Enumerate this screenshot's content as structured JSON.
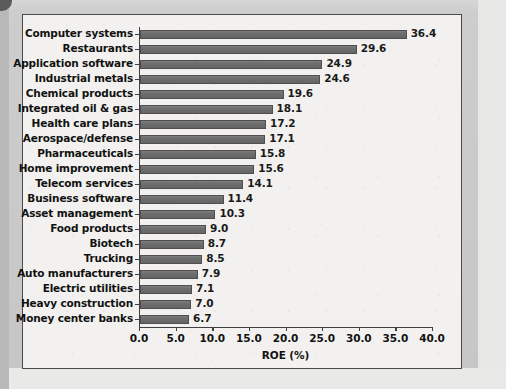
{
  "chart_data": {
    "type": "bar",
    "orientation": "horizontal",
    "title": "",
    "xlabel": "ROE (%)",
    "ylabel": "",
    "xlim": [
      0.0,
      40.0
    ],
    "xticks": [
      "0.0",
      "5.0",
      "10.0",
      "15.0",
      "20.0",
      "25.0",
      "30.0",
      "35.0",
      "40.0"
    ],
    "xtick_values": [
      0.0,
      5.0,
      10.0,
      15.0,
      20.0,
      25.0,
      30.0,
      35.0,
      40.0
    ],
    "grid": false,
    "legend": null,
    "bar_color": "#6e6e6e",
    "categories": [
      "Computer systems",
      "Restaurants",
      "Application software",
      "Industrial metals",
      "Chemical products",
      "Integrated oil & gas",
      "Health care plans",
      "Aerospace/defense",
      "Pharmaceuticals",
      "Home improvement",
      "Telecom services",
      "Business software",
      "Asset management",
      "Food products",
      "Biotech",
      "Trucking",
      "Auto manufacturers",
      "Electric utilities",
      "Heavy construction",
      "Money center banks"
    ],
    "values": [
      36.4,
      29.6,
      24.9,
      24.6,
      19.6,
      18.1,
      17.2,
      17.1,
      15.8,
      15.6,
      14.1,
      11.4,
      10.3,
      9.0,
      8.7,
      8.5,
      7.9,
      7.1,
      7.0,
      6.7
    ],
    "value_labels": [
      "36.4",
      "29.6",
      "24.9",
      "24.6",
      "19.6",
      "18.1",
      "17.2",
      "17.1",
      "15.8",
      "15.6",
      "14.1",
      "11.4",
      "10.3",
      "9.0",
      "8.7",
      "8.5",
      "7.9",
      "7.1",
      "7.0",
      "6.7"
    ]
  }
}
